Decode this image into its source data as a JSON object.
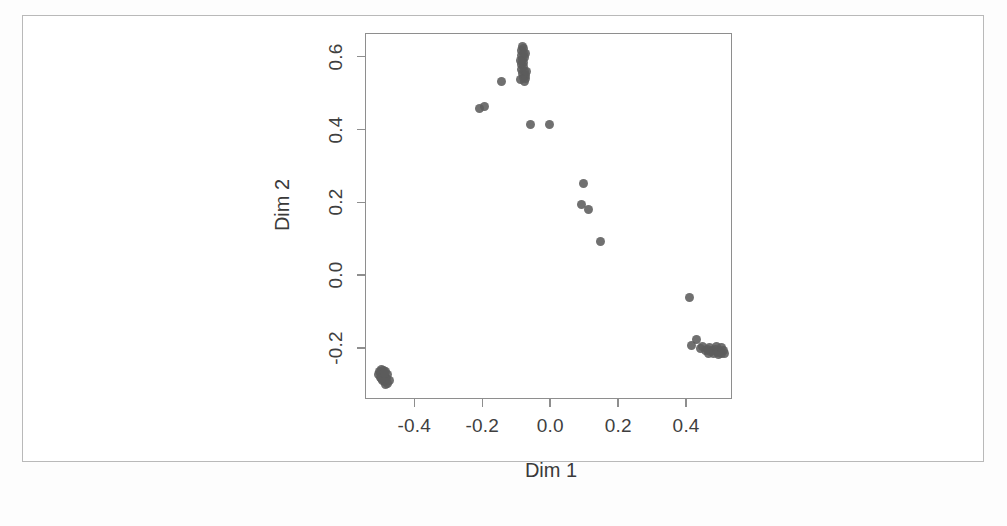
{
  "chart_data": {
    "type": "scatter",
    "title": "",
    "xlabel": "Dim 1",
    "ylabel": "Dim 2",
    "xlim": [
      -0.545,
      0.535
    ],
    "ylim": [
      -0.34,
      0.665
    ],
    "xticks": [
      -0.4,
      -0.2,
      0.0,
      0.2,
      0.4
    ],
    "xticklabels": [
      "-0.4",
      "-0.2",
      "0.0",
      "0.2",
      "0.4"
    ],
    "yticks": [
      -0.2,
      0.0,
      0.2,
      0.4,
      0.6
    ],
    "yticklabels": [
      "-0.2",
      "0.0",
      "0.2",
      "0.4",
      "0.6"
    ],
    "grid": false,
    "legend": null,
    "marker": "filled-circle",
    "marker_color": "#5c5c5c",
    "points": [
      [
        -0.505,
        -0.272
      ],
      [
        -0.498,
        -0.268
      ],
      [
        -0.5,
        -0.28
      ],
      [
        -0.492,
        -0.276
      ],
      [
        -0.486,
        -0.281
      ],
      [
        -0.494,
        -0.288
      ],
      [
        -0.488,
        -0.293
      ],
      [
        -0.481,
        -0.285
      ],
      [
        -0.479,
        -0.272
      ],
      [
        -0.484,
        -0.265
      ],
      [
        -0.497,
        -0.259
      ],
      [
        -0.503,
        -0.265
      ],
      [
        -0.49,
        -0.262
      ],
      [
        -0.485,
        -0.299
      ],
      [
        -0.478,
        -0.297
      ],
      [
        -0.473,
        -0.288
      ],
      [
        -0.495,
        -0.284
      ],
      [
        -0.489,
        -0.271
      ],
      [
        -0.207,
        0.458
      ],
      [
        -0.193,
        0.464
      ],
      [
        -0.142,
        0.531
      ],
      [
        -0.082,
        0.628
      ],
      [
        -0.078,
        0.622
      ],
      [
        -0.085,
        0.616
      ],
      [
        -0.079,
        0.61
      ],
      [
        -0.083,
        0.603
      ],
      [
        -0.077,
        0.598
      ],
      [
        -0.082,
        0.592
      ],
      [
        -0.078,
        0.585
      ],
      [
        -0.084,
        0.578
      ],
      [
        -0.079,
        0.572
      ],
      [
        -0.083,
        0.566
      ],
      [
        -0.076,
        0.56
      ],
      [
        -0.081,
        0.553
      ],
      [
        -0.074,
        0.548
      ],
      [
        -0.08,
        0.542
      ],
      [
        -0.086,
        0.536
      ],
      [
        -0.072,
        0.54
      ],
      [
        -0.077,
        0.531
      ],
      [
        -0.07,
        0.558
      ],
      [
        -0.088,
        0.59
      ],
      [
        -0.072,
        0.608
      ],
      [
        -0.057,
        0.414
      ],
      [
        -0.001,
        0.414
      ],
      [
        0.097,
        0.251
      ],
      [
        0.091,
        0.194
      ],
      [
        0.112,
        0.179
      ],
      [
        0.147,
        0.092
      ],
      [
        0.411,
        -0.061
      ],
      [
        0.432,
        -0.177
      ],
      [
        0.417,
        -0.193
      ],
      [
        0.449,
        -0.197
      ],
      [
        0.462,
        -0.204
      ],
      [
        0.47,
        -0.198
      ],
      [
        0.478,
        -0.207
      ],
      [
        0.486,
        -0.203
      ],
      [
        0.492,
        -0.211
      ],
      [
        0.498,
        -0.206
      ],
      [
        0.503,
        -0.214
      ],
      [
        0.509,
        -0.208
      ],
      [
        0.496,
        -0.218
      ],
      [
        0.481,
        -0.214
      ],
      [
        0.473,
        -0.209
      ],
      [
        0.466,
        -0.214
      ],
      [
        0.489,
        -0.196
      ],
      [
        0.505,
        -0.199
      ],
      [
        0.512,
        -0.216
      ],
      [
        0.458,
        -0.208
      ],
      [
        0.443,
        -0.201
      ]
    ]
  },
  "axes": {
    "x_label": "Dim 1",
    "y_label": "Dim 2"
  }
}
